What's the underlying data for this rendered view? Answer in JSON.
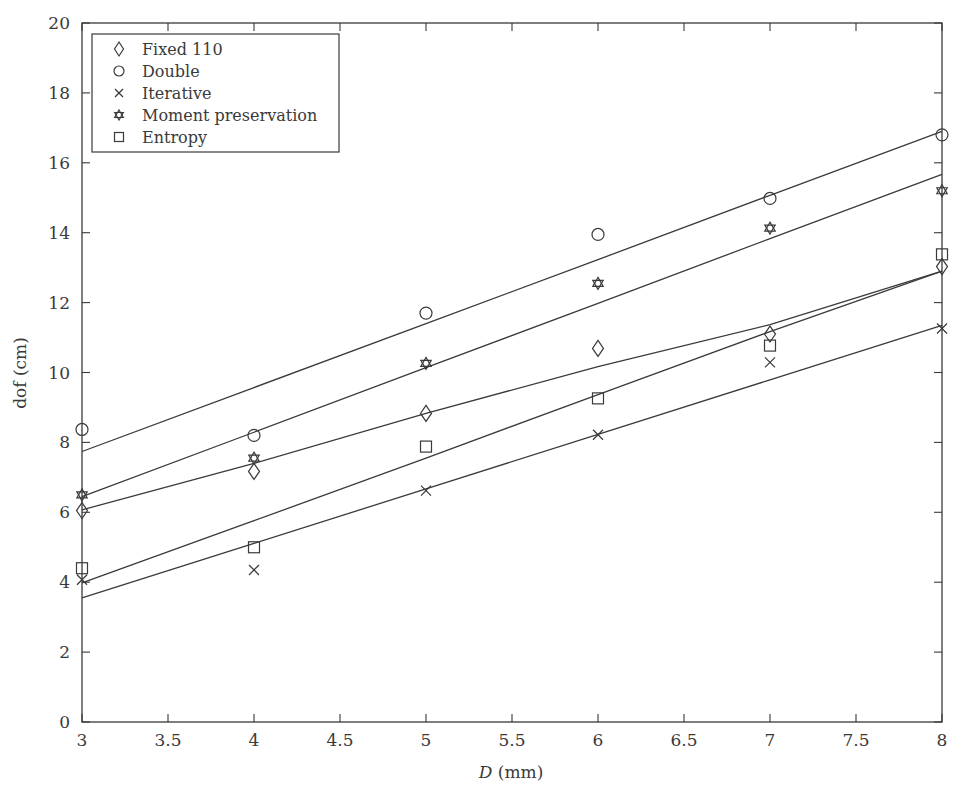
{
  "chart_data": {
    "type": "scatter",
    "title": "",
    "xlabel": "D (mm)",
    "xlabel_italic_part": "D",
    "xlabel_unit": " (mm)",
    "ylabel": "dof (cm)",
    "xlim": [
      3,
      8
    ],
    "ylim": [
      0,
      20
    ],
    "grid": false,
    "legend_position": "upper left",
    "x": [
      3,
      4,
      5,
      6,
      7,
      8
    ],
    "xticks": [
      3,
      3.5,
      4,
      4.5,
      5,
      5.5,
      6,
      6.5,
      7,
      7.5,
      8
    ],
    "xtick_labels": [
      "3",
      "3.5",
      "4",
      "4.5",
      "5",
      "5.5",
      "6",
      "6.5",
      "7",
      "7.5",
      "8"
    ],
    "yticks": [
      0,
      2,
      4,
      6,
      8,
      10,
      12,
      14,
      16,
      18,
      20
    ],
    "ytick_labels": [
      "0",
      "2",
      "4",
      "6",
      "8",
      "10",
      "12",
      "14",
      "16",
      "18",
      "20"
    ],
    "series": [
      {
        "name": "Fixed 110",
        "marker": "diamond",
        "values": [
          6.05,
          7.17,
          8.83,
          10.69,
          11.1,
          13.03
        ],
        "fit": [
          6.07,
          7.4,
          8.83,
          10.17,
          11.37,
          12.9
        ]
      },
      {
        "name": "Double",
        "marker": "circle",
        "values": [
          8.37,
          8.2,
          11.7,
          13.95,
          14.98,
          16.8
        ],
        "fit": [
          7.74,
          9.57,
          11.4,
          13.23,
          15.07,
          16.9
        ]
      },
      {
        "name": "Iterative",
        "marker": "x",
        "values": [
          4.07,
          4.35,
          6.62,
          8.22,
          10.29,
          11.26
        ],
        "fit": [
          3.55,
          5.11,
          6.67,
          8.23,
          9.79,
          11.35
        ]
      },
      {
        "name": "Moment preservation",
        "marker": "star",
        "values": [
          6.5,
          7.55,
          10.26,
          12.55,
          14.13,
          15.2
        ],
        "fit": [
          6.45,
          8.29,
          10.14,
          11.98,
          13.83,
          15.67
        ]
      },
      {
        "name": "Entropy",
        "marker": "square",
        "values": [
          4.4,
          5.0,
          7.88,
          9.26,
          10.77,
          13.38
        ],
        "fit": [
          3.98,
          5.76,
          7.55,
          9.37,
          11.17,
          12.9
        ]
      }
    ]
  },
  "legend": {
    "items": [
      {
        "label": "Fixed 110",
        "marker": "diamond"
      },
      {
        "label": "Double",
        "marker": "circle"
      },
      {
        "label": "Iterative",
        "marker": "x"
      },
      {
        "label": "Moment preservation",
        "marker": "star"
      },
      {
        "label": "Entropy",
        "marker": "square"
      }
    ]
  },
  "colors": {
    "ink": "#3a3a3a",
    "background": "#ffffff"
  }
}
